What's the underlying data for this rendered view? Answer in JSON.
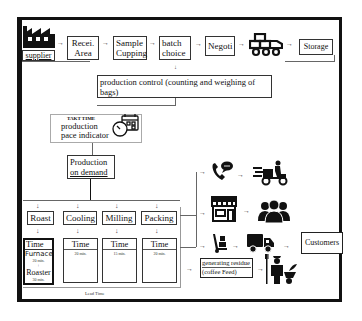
{
  "top_flow": {
    "supplier": "supplier",
    "receiving": "Recei.\nArea",
    "receiving_l1": "Recei.",
    "receiving_l2": "Area",
    "cupping_l1": "Sample",
    "cupping_l2": "Cupping",
    "batch_l1": "batch",
    "batch_l2": "choice",
    "negotiation": "Negoti",
    "storage": "Storage"
  },
  "production_control": "production control (counting and weighing of bags)",
  "takt": {
    "title": "TAKT TIME",
    "l1": "production",
    "l2": "pace indicator"
  },
  "production_on_demand_l1": "Production",
  "production_on_demand_l2": "on demand",
  "stages": [
    {
      "name": "Roast",
      "time_label": "Time",
      "details": [
        "Furnace",
        "20 min.",
        "+",
        "Roaster",
        "30 min."
      ]
    },
    {
      "name": "Cooling",
      "time_label": "Time",
      "details": [
        "20 min."
      ]
    },
    {
      "name": "Milling",
      "time_label": "Time",
      "details": [
        "15 min."
      ]
    },
    {
      "name": "Packing",
      "time_label": "Time",
      "details": [
        "20 min."
      ]
    }
  ],
  "lead_time": "Lead Time",
  "distribution": {
    "customers": "Customers",
    "residue_l1": "generating residue",
    "residue_l2": "(coffee Feed)"
  }
}
